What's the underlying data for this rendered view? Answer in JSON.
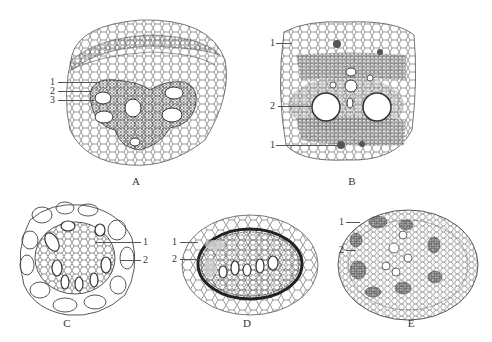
{
  "figure": {
    "panels": [
      {
        "id": "A",
        "label": "A",
        "description": "cross-section with multi-bundle vascular cylinder",
        "callouts": [
          {
            "number": "1"
          },
          {
            "number": "2"
          },
          {
            "number": "3"
          }
        ]
      },
      {
        "id": "B",
        "label": "B",
        "description": "cross-section with two large vessels",
        "callouts": [
          {
            "number": "1"
          },
          {
            "number": "2"
          },
          {
            "number": "1"
          }
        ]
      },
      {
        "id": "C",
        "label": "C",
        "description": "small round cross-section",
        "callouts": [
          {
            "number": "1"
          },
          {
            "number": "2"
          }
        ]
      },
      {
        "id": "D",
        "label": "D",
        "description": "oval cross-section with dense sheath",
        "callouts": [
          {
            "number": "1"
          },
          {
            "number": "2"
          }
        ]
      },
      {
        "id": "E",
        "label": "E",
        "description": "round cross-section with scattered bundles",
        "callouts": [
          {
            "number": "1"
          },
          {
            "number": "2"
          }
        ]
      }
    ],
    "colors": {
      "line": "#4a4a4a",
      "dark_tissue": "#6a6a6a",
      "background": "#ffffff"
    }
  }
}
